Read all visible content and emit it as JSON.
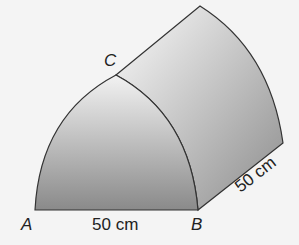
{
  "diagram": {
    "vertices": {
      "A": "A",
      "B": "B",
      "C": "C"
    },
    "dimensions": {
      "base": "50 cm",
      "depth": "50 cm"
    }
  }
}
